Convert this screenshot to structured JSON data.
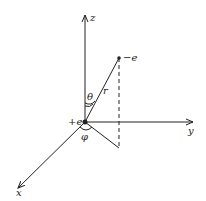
{
  "diagram": {
    "type": "3d-coordinate-system",
    "axes": {
      "z": "z",
      "y": "y",
      "x": "x"
    },
    "charges": {
      "origin": "+e",
      "point": "−e"
    },
    "labels": {
      "radius": "r",
      "polar_angle": "θ",
      "azimuthal_angle": "φ"
    },
    "color": "#222222"
  }
}
